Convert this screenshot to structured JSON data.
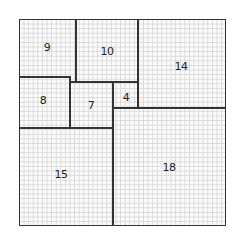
{
  "diagram": {
    "title": "",
    "type": "squared-square tiling on graph paper",
    "colors": {
      "line": "#333333",
      "grid": "#d9d9d9",
      "background": "#ffffff"
    },
    "squares": [
      {
        "id": "sq-9",
        "label": "9",
        "x": 47,
        "y": 47
      },
      {
        "id": "sq-10",
        "label": "10",
        "x": 107,
        "y": 51
      },
      {
        "id": "sq-14",
        "label": "14",
        "x": 181,
        "y": 66
      },
      {
        "id": "sq-8",
        "label": "8",
        "x": 43,
        "y": 100
      },
      {
        "id": "sq-7",
        "label": "7",
        "x": 91,
        "y": 105
      },
      {
        "id": "sq-4",
        "label": "4",
        "x": 126,
        "y": 97
      },
      {
        "id": "sq-15",
        "label": "15",
        "x": 61,
        "y": 174
      },
      {
        "id": "sq-18",
        "label": "18",
        "x": 169,
        "y": 167
      }
    ]
  }
}
